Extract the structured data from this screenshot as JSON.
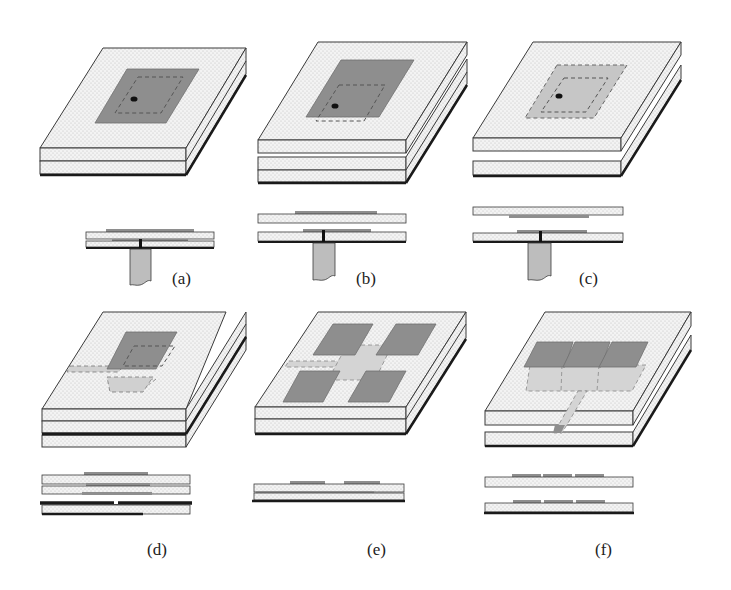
{
  "figure": {
    "panels": [
      {
        "id": "a",
        "label": "(a)",
        "description": "Probe-fed single-layer patch with buried feed"
      },
      {
        "id": "b",
        "label": "(b)",
        "description": "Stacked patch, probe-fed lower patch"
      },
      {
        "id": "c",
        "label": "(c)",
        "description": "Stacked patch with air gap, parasitic upper patch"
      },
      {
        "id": "d",
        "label": "(d)",
        "description": "Aperture-coupled patch with microstrip feed"
      },
      {
        "id": "e",
        "label": "(e)",
        "description": "Proximity-coupled 2x2 patch array with cross feed"
      },
      {
        "id": "f",
        "label": "(f)",
        "description": "Stacked 1x3 patch array with microstrip feed line"
      }
    ]
  },
  "colors": {
    "substrate": "#f1f1f1",
    "substrate_dot": "#c8c8c8",
    "patch_dark": "#8e8e8e",
    "patch_light": "#c6c6c6",
    "outline": "#3a3a3a",
    "ground": "#1a1a1a",
    "probe": "#bdbdbd",
    "background": "#ffffff"
  }
}
